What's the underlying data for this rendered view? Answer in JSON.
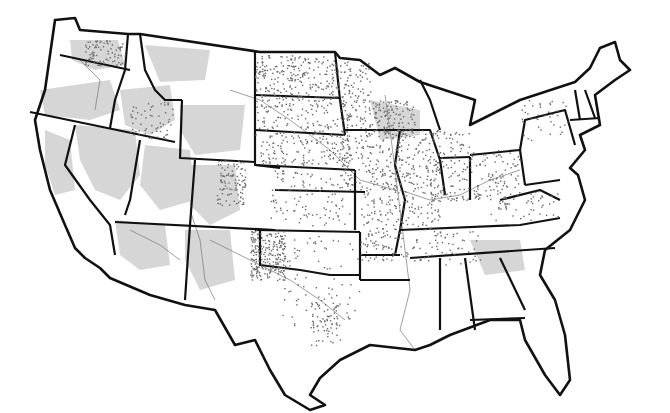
{
  "map": {
    "title": "",
    "region": "Contiguous United States",
    "style": "grayscale state outline map with shaded areas, rivers and point density dots",
    "colors": {
      "background": "#ffffff",
      "land": "#ffffff",
      "shaded_area": "#d6d6d6",
      "border": "#111111",
      "dots": "#6a6a6a",
      "rivers": "#777777"
    },
    "dense_dot_regions": [
      "North Dakota",
      "Iowa",
      "Illinois",
      "Indiana",
      "Ohio",
      "Kansas",
      "Nebraska",
      "West Texas (Permian Basin)",
      "Eastern Colorado",
      "Western Washington",
      "Southern Idaho",
      "Minnesota",
      "Missouri",
      "South Texas"
    ],
    "sparse_regions": [
      "Nevada",
      "Arizona",
      "New Mexico",
      "Utah",
      "Wyoming",
      "New England",
      "Florida"
    ],
    "labels": []
  }
}
